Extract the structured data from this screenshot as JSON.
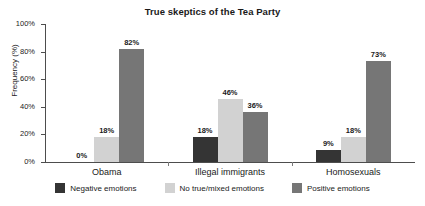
{
  "chart_data": {
    "type": "bar",
    "title": "True skeptics of the Tea Party",
    "xlabel": "",
    "ylabel": "Frequency (%)",
    "ylim": [
      0,
      100
    ],
    "ytick_labels": [
      "0%",
      "20%",
      "40%",
      "60%",
      "80%",
      "100%"
    ],
    "ytick_values": [
      0,
      20,
      40,
      60,
      80,
      100
    ],
    "grid": false,
    "legend_position": "bottom",
    "categories": [
      "Obama",
      "Illegal immigrants",
      "Homosexuals"
    ],
    "series": [
      {
        "name": "Negative emotions",
        "color": "#343434",
        "values": [
          0,
          18,
          9
        ],
        "labels": [
          "0%",
          "18%",
          "9%"
        ]
      },
      {
        "name": "No true/mixed emotions",
        "color": "#d2d2d2",
        "values": [
          18,
          46,
          18
        ],
        "labels": [
          "18%",
          "46%",
          "18%"
        ]
      },
      {
        "name": "Positive emotions",
        "color": "#767676",
        "values": [
          82,
          36,
          73
        ],
        "labels": [
          "82%",
          "36%",
          "73%"
        ]
      }
    ]
  }
}
